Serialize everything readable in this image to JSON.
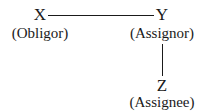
{
  "diagram": {
    "nodes": [
      {
        "id": "x",
        "letter": "X",
        "role": "(Obligor)"
      },
      {
        "id": "y",
        "letter": "Y",
        "role": "(Assignor)"
      },
      {
        "id": "z",
        "letter": "Z",
        "role": "(Assignee)"
      }
    ],
    "edges": [
      {
        "from": "X",
        "to": "Y",
        "orientation": "horizontal"
      },
      {
        "from": "Y",
        "to": "Z",
        "orientation": "vertical"
      }
    ]
  }
}
